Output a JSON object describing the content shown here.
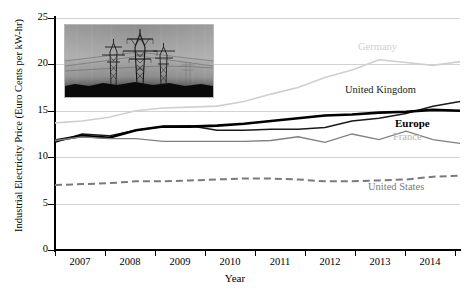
{
  "chart_data": {
    "type": "line",
    "title": "",
    "xlabel": "Year",
    "ylabel": "Industrial Electricity Price (Euro Cents per kW-hr)",
    "ylim": [
      0,
      25
    ],
    "yticks": [
      0,
      5,
      10,
      15,
      20,
      25
    ],
    "xlim": [
      2007.0,
      2014.5
    ],
    "xticks": [
      2007,
      2008,
      2009,
      2010,
      2011,
      2012,
      2013,
      2014
    ],
    "xticklabels": [
      "2007",
      "2008",
      "2009",
      "2010",
      "2011",
      "2012",
      "2013",
      "2014"
    ],
    "grid": true,
    "legend_position": "inline-right",
    "x": [
      2007.0,
      2007.5,
      2008.0,
      2008.5,
      2009.0,
      2009.5,
      2010.0,
      2010.5,
      2011.0,
      2011.5,
      2012.0,
      2012.5,
      2013.0,
      2013.5,
      2014.0,
      2014.5
    ],
    "series": [
      {
        "name": "Germany",
        "color": "#cfcfcf",
        "style": "solid",
        "width": 1.6,
        "values": [
          13.7,
          13.9,
          14.3,
          15.0,
          15.3,
          15.4,
          15.5,
          16.0,
          16.8,
          17.5,
          18.6,
          19.4,
          20.5,
          20.2,
          19.9,
          20.3
        ]
      },
      {
        "name": "United Kingdom",
        "color": "#1a1a1a",
        "style": "solid",
        "width": 1.5,
        "values": [
          11.6,
          12.5,
          12.3,
          12.9,
          13.3,
          13.4,
          12.9,
          12.9,
          13.0,
          13.0,
          13.2,
          13.9,
          14.2,
          14.7,
          15.5,
          16.0
        ]
      },
      {
        "name": "Europe",
        "color": "#000000",
        "style": "solid",
        "width": 2.6,
        "values": [
          11.8,
          12.3,
          12.1,
          12.9,
          13.3,
          13.3,
          13.4,
          13.6,
          13.9,
          14.2,
          14.5,
          14.6,
          14.8,
          14.9,
          15.1,
          15.0
        ]
      },
      {
        "name": "France",
        "color": "#808080",
        "style": "solid",
        "width": 1.3,
        "values": [
          11.8,
          12.2,
          12.0,
          12.0,
          11.7,
          11.7,
          11.7,
          11.7,
          11.8,
          12.2,
          11.6,
          12.5,
          11.9,
          12.8,
          11.9,
          11.5
        ]
      },
      {
        "name": "United States",
        "color": "#7a7a7a",
        "style": "dashed",
        "width": 2.0,
        "values": [
          7.0,
          7.1,
          7.2,
          7.4,
          7.4,
          7.5,
          7.6,
          7.7,
          7.7,
          7.6,
          7.4,
          7.4,
          7.5,
          7.6,
          7.9,
          8.0
        ]
      }
    ],
    "inset_image": {
      "name": "power-transmission-lines-photo",
      "description": "Photograph of electricity transmission towers at dusk"
    }
  },
  "labels": {
    "germany": "Germany",
    "united_kingdom": "United Kingdom",
    "europe": "Europe",
    "france": "France",
    "united_states": "United States"
  },
  "axis": {
    "y_title": "Industrial Electricity Price (Euro Cents per kW-hr)",
    "x_title": "Year",
    "y_ticks": [
      "0",
      "5",
      "10",
      "15",
      "20",
      "25"
    ],
    "x_ticks": [
      "2007",
      "2008",
      "2009",
      "2010",
      "2011",
      "2012",
      "2013",
      "2014"
    ]
  }
}
